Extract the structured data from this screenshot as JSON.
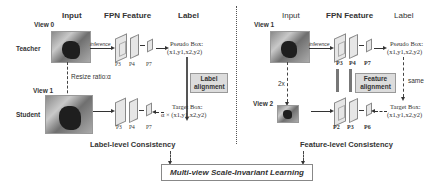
{
  "left": {
    "headers": {
      "input": "Input",
      "fpn": "FPN Feature",
      "label": "Label"
    },
    "view_top": "View 0",
    "view_bottom": "View 1",
    "role_top": "Teacher",
    "role_bottom": "Student",
    "inference": "inference",
    "resize": "Resize ratio:α",
    "levels_top": [
      "P3",
      "P4",
      "P7"
    ],
    "levels_bottom": [
      "P3",
      "P4",
      "P7"
    ],
    "pseudo_box": "Pseudo Box:",
    "pseudo_coords": "(x1,y1,x2,y2)",
    "alignment_line1": "Label",
    "alignment_line2": "alignment",
    "target_box": "Target Box:",
    "target_coords": "α × (x1,y1,x2,y2)",
    "consistency": "Label-level Consistency"
  },
  "right": {
    "headers": {
      "input": "Input",
      "fpn": "FPN Feature",
      "label": "Label"
    },
    "view_top": "View 1",
    "view_bottom": "View 2",
    "inference": "inference",
    "scale": "2x",
    "levels_top": [
      "P3",
      "P4",
      "P7"
    ],
    "levels_bottom": [
      "P2",
      "P3",
      "P6"
    ],
    "pseudo_box": "Pseudo Box:",
    "pseudo_coords": "(x1,y1,x2,y2)",
    "alignment_line1": "Feature",
    "alignment_line2": "alignment",
    "same": "same",
    "target_box": "Target Box:",
    "target_coords": "(x1,y1,x2,y2)",
    "consistency": "Feature-level Consistency"
  },
  "final": "Multi-view Scale-Invariant Learning"
}
